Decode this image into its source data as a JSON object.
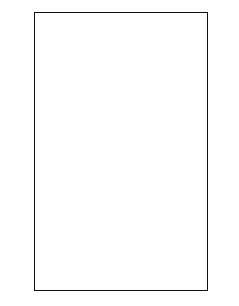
{
  "chart": {
    "columns": 13,
    "rows": 20,
    "dot_color": "#111111",
    "grid_color": "#111111",
    "label_color": "#777777",
    "left_labels": [
      "20",
      "18",
      "16",
      "14",
      "12",
      "10",
      "8",
      "6",
      "4",
      "2"
    ],
    "right_labels": [
      "19",
      "17",
      "15",
      "13",
      "11",
      "9",
      "7",
      "5",
      "3",
      "1"
    ],
    "pattern": {
      "20": [],
      "19": [
        6,
        7,
        8
      ],
      "18": [
        6,
        8
      ],
      "17": [
        5,
        6,
        8,
        9
      ],
      "16": [
        4,
        5,
        9,
        10
      ],
      "15": [
        3,
        4,
        7,
        10,
        11
      ],
      "14": [
        2,
        3,
        6,
        7,
        8,
        11,
        12
      ],
      "13": [
        2,
        5,
        6,
        8,
        9,
        12
      ],
      "12": [
        2,
        4,
        5,
        9,
        10,
        12
      ],
      "11": [
        2,
        3,
        4,
        7,
        10,
        11,
        12
      ],
      "10": [
        2,
        3,
        4,
        7,
        10,
        11,
        12
      ],
      "9": [
        2,
        4,
        5,
        9,
        10,
        12
      ],
      "8": [
        2,
        5,
        6,
        8,
        9,
        12
      ],
      "7": [
        2,
        3,
        6,
        7,
        8,
        11,
        12
      ],
      "6": [
        3,
        4,
        7,
        10,
        11
      ],
      "5": [
        4,
        5,
        9,
        10
      ],
      "4": [
        5,
        6,
        8,
        9
      ],
      "3": [
        6,
        8
      ],
      "2": [
        6,
        7,
        8
      ],
      "1": []
    }
  }
}
